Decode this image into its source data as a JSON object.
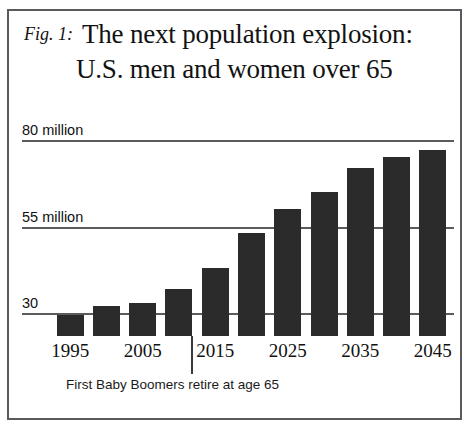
{
  "figure": {
    "fig_label": "Fig. 1:",
    "title_line_1": "The next population explosion:",
    "title_line_2": "U.S. men and women over 65",
    "border_color": "#5a5a5e",
    "bar_color": "#2b2b2b",
    "gridline_color": "#5b5b5f",
    "background_color": "#ffffff"
  },
  "annotation": {
    "text": "First Baby Boomers retire at age 65",
    "points_at_year": 2011
  },
  "chart_data": {
    "type": "bar",
    "title": "The next population explosion: U.S. men and women over 65",
    "subtitle": "Fig. 1:",
    "xlabel": "",
    "ylabel": "",
    "categories": [
      1995,
      2000,
      2005,
      2010,
      2015,
      2020,
      2025,
      2030,
      2035,
      2040,
      2045
    ],
    "tick_labels_x": [
      "1995",
      "",
      "2005",
      "",
      "2015",
      "",
      "2025",
      "",
      "2035",
      "",
      "2045"
    ],
    "values": [
      29.5,
      32,
      33,
      37,
      43,
      53,
      60,
      65,
      72,
      75,
      77
    ],
    "value_unit": "million",
    "ytick_values": [
      30,
      55,
      80
    ],
    "ytick_labels": [
      "30",
      "55 million",
      "80 million"
    ],
    "ylim": [
      19,
      83
    ],
    "grid": true,
    "grid_axis": "y",
    "legend": false
  }
}
